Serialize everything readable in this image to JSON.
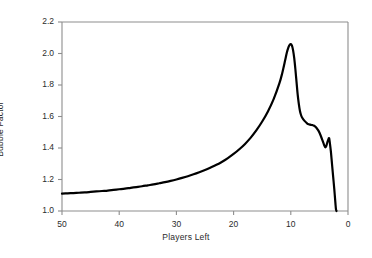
{
  "chart_data": {
    "type": "line",
    "title": "",
    "xlabel": "Players Left",
    "ylabel": "Bubble Factor",
    "xlim": [
      50,
      0
    ],
    "ylim": [
      1.0,
      2.2
    ],
    "x_inverted": true,
    "grid": false,
    "legend": "none",
    "xticks": [
      "50",
      "40",
      "30",
      "20",
      "10",
      "0"
    ],
    "xtick_values": [
      50,
      40,
      30,
      20,
      10,
      0
    ],
    "yticks": [
      "1.0",
      "1.2",
      "1.4",
      "1.6",
      "1.8",
      "2.0",
      "2.2"
    ],
    "ytick_values": [
      1.0,
      1.2,
      1.4,
      1.6,
      1.8,
      2.0,
      2.2
    ],
    "line_color": "#000000",
    "line_width": 2.2,
    "axis_color": "#888888",
    "background": "#ffffff",
    "series": [
      {
        "name": "Bubble Factor",
        "x": [
          50,
          49,
          48,
          47,
          46,
          45,
          44,
          43,
          42,
          41,
          40,
          39,
          38,
          37,
          36,
          35,
          34,
          33,
          32,
          31,
          30,
          29,
          28,
          27,
          26,
          25,
          24,
          23,
          22,
          21,
          20,
          19,
          18,
          17,
          16,
          15,
          14,
          13,
          12,
          11.5,
          11,
          10.7,
          10.4,
          10.2,
          10.0,
          9.8,
          9.6,
          9.4,
          9.2,
          9.0,
          8.8,
          8.6,
          8.4,
          8.2,
          8.0,
          7.6,
          7.2,
          7.0,
          6.6,
          6.2,
          6.0,
          5.6,
          5.2,
          5.0,
          4.6,
          4.2,
          4.0,
          3.8,
          3.6,
          3.4,
          3.3,
          3.2,
          3.0,
          2.8,
          2.6,
          2.4,
          2.2,
          2.1,
          2.0
        ],
        "values": [
          1.11,
          1.112,
          1.114,
          1.116,
          1.118,
          1.121,
          1.124,
          1.127,
          1.13,
          1.134,
          1.138,
          1.142,
          1.147,
          1.152,
          1.157,
          1.163,
          1.169,
          1.176,
          1.183,
          1.191,
          1.2,
          1.21,
          1.221,
          1.233,
          1.246,
          1.26,
          1.276,
          1.293,
          1.313,
          1.336,
          1.362,
          1.392,
          1.426,
          1.466,
          1.513,
          1.568,
          1.632,
          1.71,
          1.81,
          1.875,
          1.955,
          2.005,
          2.04,
          2.055,
          2.06,
          2.05,
          2.02,
          1.97,
          1.9,
          1.82,
          1.74,
          1.68,
          1.635,
          1.608,
          1.592,
          1.572,
          1.558,
          1.552,
          1.548,
          1.545,
          1.543,
          1.532,
          1.512,
          1.498,
          1.462,
          1.422,
          1.405,
          1.412,
          1.438,
          1.458,
          1.462,
          1.44,
          1.38,
          1.3,
          1.22,
          1.14,
          1.05,
          1.01,
          1.0
        ]
      }
    ]
  },
  "figure": {
    "ylabel_text": "Bubble Factor",
    "xlabel_text": "Players Left",
    "ytick_labels": [
      "2.2",
      "2.0",
      "1.8",
      "1.6",
      "1.4",
      "1.2",
      "1.0"
    ],
    "xtick_labels": [
      "50",
      "40",
      "30",
      "20",
      "10",
      "0"
    ]
  }
}
